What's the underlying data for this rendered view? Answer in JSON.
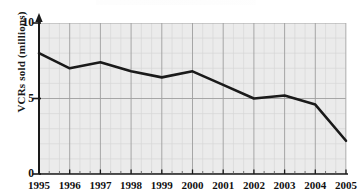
{
  "chart_data": {
    "type": "line",
    "title": "",
    "xlabel": "",
    "ylabel": "VCRs sold  (millions)",
    "categories": [
      "1995",
      "1996",
      "1997",
      "1998",
      "1999",
      "2000",
      "2001",
      "2002",
      "2003",
      "2004",
      "2005"
    ],
    "values": [
      8.0,
      7.0,
      7.4,
      6.8,
      6.4,
      6.8,
      5.9,
      5.0,
      5.2,
      4.6,
      2.2
    ],
    "series": [
      {
        "name": "VCRs sold (millions)",
        "values": [
          8.0,
          7.0,
          7.4,
          6.8,
          6.4,
          6.8,
          5.9,
          5.0,
          5.2,
          4.6,
          2.2
        ]
      }
    ],
    "x": [
      1995,
      1996,
      1997,
      1998,
      1999,
      2000,
      2001,
      2002,
      2003,
      2004,
      2005
    ],
    "xlim": [
      1995,
      2005
    ],
    "ylim": [
      0,
      10
    ],
    "ytick_labels": [
      "0",
      "5",
      "10"
    ],
    "ytick_values": [
      0,
      5,
      10
    ],
    "xtick_labels": [
      "1995",
      "1996",
      "1997",
      "1998",
      "1999",
      "2000",
      "2001",
      "2002",
      "2003",
      "2004",
      "2005"
    ],
    "grid": true,
    "grid_minor": true,
    "legend": "none",
    "legend_position": "none",
    "annotations": [],
    "colors": {
      "line": "#1a1a1a",
      "plot_background": "#ebebeb",
      "grid_major": "#9e9e9e",
      "grid_minor": "#d7d7d7",
      "axis": "#1a1a1a",
      "text": "#111111",
      "page_background": "#ffffff"
    }
  },
  "axes": {
    "y_axis_name": "y-axis",
    "x_axis_name": "x-axis",
    "y_label_text": "VCRs sold  (millions)",
    "y_ticks": [
      {
        "label": "10",
        "value": 10
      },
      {
        "label": "5",
        "value": 5
      },
      {
        "label": "0",
        "value": 0
      }
    ],
    "x_ticks": [
      {
        "label": "1995",
        "value": 1995
      },
      {
        "label": "1996",
        "value": 1996
      },
      {
        "label": "1997",
        "value": 1997
      },
      {
        "label": "1998",
        "value": 1998
      },
      {
        "label": "1999",
        "value": 1999
      },
      {
        "label": "2000",
        "value": 2000
      },
      {
        "label": "2001",
        "value": 2001
      },
      {
        "label": "2002",
        "value": 2002
      },
      {
        "label": "2003",
        "value": 2003
      },
      {
        "label": "2004",
        "value": 2004
      },
      {
        "label": "2005",
        "value": 2005
      }
    ]
  }
}
